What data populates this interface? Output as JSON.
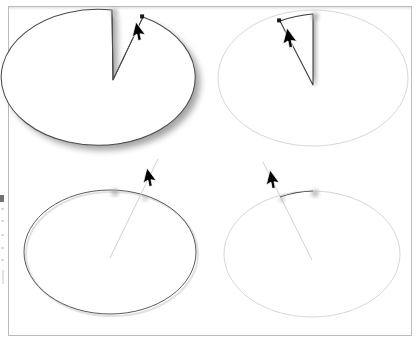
{
  "figure": {
    "title": "",
    "caption": "",
    "background_color": "#ffffff",
    "frame_color": "#b9bcc0",
    "panel_count": 4
  },
  "colors": {
    "stroke_dark": "#4a4a4a",
    "stroke_darker": "#2e2e2e",
    "stroke_faint": "#d6d7d9",
    "stroke_thin_light": "#cfd0d2",
    "handle_light_fill": "#e8e8e8",
    "handle_light_stroke": "#8d8f91",
    "handle_dark_fill": "#1a1a1a",
    "handle_shadow": "#b7b8ba",
    "shape_fill": "#ffffff",
    "drop_shadow": "#9a9b9d",
    "cursor_fill": "#000000",
    "cursor_stroke": "#ffffff"
  },
  "panels": [
    {
      "id": "panel-top-left",
      "name": "filled-pie-with-wedge-removed",
      "state_label": "",
      "ellipse": {
        "cx": 113,
        "cy": 78,
        "rx": 97,
        "ry": 68
      },
      "filled": true,
      "ellipse_stroke": "#4a4a4a",
      "has_drop_shadow": true,
      "wedge": {
        "apex_x": 113,
        "apex_y": 80,
        "start_x": 112,
        "start_y": 10,
        "end_x": 143,
        "end_y": 17,
        "stroke": "#4a4a4a"
      },
      "handles": [
        {
          "type": "square-light",
          "x": 112,
          "y": 10,
          "size": 5
        },
        {
          "type": "square-dark",
          "x": 143,
          "y": 17,
          "size": 4
        }
      ],
      "cursor": {
        "x": 136,
        "y": 22
      }
    },
    {
      "id": "panel-top-right",
      "name": "faded-ellipse-with-wedge-outline",
      "state_label": "",
      "ellipse": {
        "cx": 313,
        "cy": 78,
        "rx": 95,
        "ry": 68
      },
      "filled": false,
      "ellipse_stroke": "#d6d7d9",
      "has_drop_shadow": false,
      "wedge": {
        "apex_x": 313,
        "apex_y": 85,
        "start_x": 313,
        "start_y": 14,
        "end_x": 280,
        "end_y": 21,
        "stroke": "#3a3a3a"
      },
      "handles": [
        {
          "type": "square-light",
          "x": 313,
          "y": 14,
          "size": 5
        },
        {
          "type": "square-dark",
          "x": 280,
          "y": 21,
          "size": 4
        }
      ],
      "cursor": {
        "x": 287,
        "y": 28
      }
    },
    {
      "id": "panel-bottom-left",
      "name": "dark-ellipse-outline-with-radius-line",
      "state_label": "",
      "ellipse": {
        "cx": 110,
        "cy": 252,
        "rx": 86,
        "ry": 62
      },
      "filled": false,
      "ellipse_stroke": "#5a5a5c",
      "has_drop_shadow": false,
      "radius_line": {
        "from_x": 110,
        "from_y": 258,
        "to_x": 158,
        "to_y": 159,
        "stroke": "#cfd0d2"
      },
      "arc_highlight": {
        "from_x": 113,
        "from_y": 190,
        "to_x": 143,
        "to_y": 196,
        "stroke": "#4a4a4a",
        "visible": false
      },
      "handles": [
        {
          "type": "square-light",
          "x": 113,
          "y": 190,
          "size": 5
        },
        {
          "type": "square-dark",
          "x": 143,
          "y": 196,
          "size": 4
        }
      ],
      "cursor": {
        "x": 147,
        "y": 168
      }
    },
    {
      "id": "panel-bottom-right",
      "name": "faded-ellipse-with-dark-arc-segment",
      "state_label": "",
      "ellipse": {
        "cx": 312,
        "cy": 254,
        "rx": 88,
        "ry": 63
      },
      "filled": false,
      "ellipse_stroke": "#d6d7d9",
      "has_drop_shadow": false,
      "radius_line": {
        "from_x": 312,
        "from_y": 260,
        "to_x": 263,
        "to_y": 162,
        "stroke": "#cfd0d2"
      },
      "arc_highlight": {
        "from_x": 280,
        "from_y": 197,
        "to_x": 313,
        "to_y": 191,
        "stroke": "#4a4a4a",
        "visible": true
      },
      "handles": [
        {
          "type": "square-dark",
          "x": 280,
          "y": 197,
          "size": 4
        },
        {
          "type": "square-light",
          "x": 313,
          "y": 191,
          "size": 5
        }
      ],
      "cursor": {
        "x": 270,
        "y": 170
      }
    }
  ],
  "icons": {
    "cursor": "mouse-pointer-arrow-icon",
    "handle_light": "resize-handle-icon",
    "handle_dark": "anchor-point-icon"
  },
  "margin_artifacts": {
    "dark_mark": {
      "x": 0,
      "y": 195,
      "width": 4,
      "height": 7
    },
    "faint_ticks": 6
  }
}
